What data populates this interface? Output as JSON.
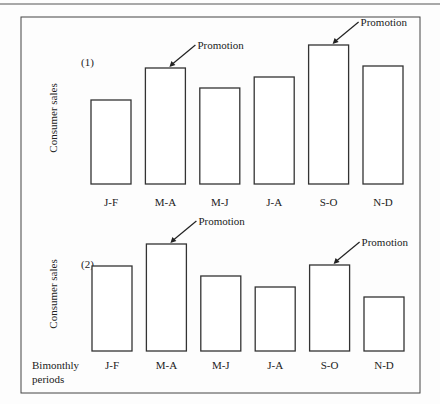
{
  "chart_data": [
    {
      "type": "bar",
      "panel_label": "(1)",
      "title": "",
      "xlabel": "",
      "ylabel": "Consumer sales",
      "categories": [
        "J-F",
        "M-A",
        "M-J",
        "J-A",
        "S-O",
        "N-D"
      ],
      "values": [
        84,
        116,
        96,
        107,
        139,
        118
      ],
      "ylim": [
        0,
        150
      ],
      "grid": false,
      "annotations": [
        {
          "text": "Promotion",
          "category": "M-A"
        },
        {
          "text": "Promotion",
          "category": "S-O"
        }
      ]
    },
    {
      "type": "bar",
      "panel_label": "(2)",
      "title": "",
      "xlabel": "Bimonthly periods",
      "ylabel": "Consumer sales",
      "categories": [
        "J-F",
        "M-A",
        "M-J",
        "J-A",
        "S-O",
        "N-D"
      ],
      "values": [
        85,
        107,
        75,
        64,
        86,
        54
      ],
      "ylim": [
        0,
        150
      ],
      "grid": false,
      "annotations": [
        {
          "text": "Promotion",
          "category": "M-A"
        },
        {
          "text": "Promotion",
          "category": "S-O"
        }
      ]
    }
  ],
  "x_axis_caption": [
    "Bimonthly",
    "periods"
  ]
}
